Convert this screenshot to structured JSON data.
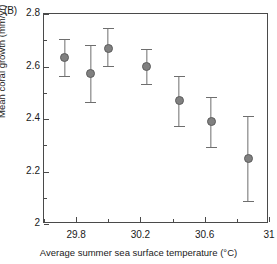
{
  "panel": {
    "label": "(B)"
  },
  "chart_data": {
    "type": "scatter",
    "title": "",
    "panel_label": "(B)",
    "xlabel": "Average summer sea surface temperature (°C)",
    "ylabel": "Mean coral growth (mm/yr)",
    "xlim": [
      29.6,
      31.0
    ],
    "ylim": [
      2.0,
      2.8
    ],
    "grid": false,
    "legend": null,
    "xticks": [
      29.8,
      30.2,
      30.6,
      31
    ],
    "xtick_labels": [
      "29.8",
      "30.2",
      "30.6",
      "31"
    ],
    "xticks_minor": [
      29.6,
      30.0,
      30.4,
      30.8
    ],
    "yticks": [
      2.0,
      2.2,
      2.4,
      2.6,
      2.8
    ],
    "ytick_labels": [
      "2",
      "2.2",
      "2.4",
      "2.6",
      "2.8"
    ],
    "yticks_minor": [
      2.1,
      2.3,
      2.5,
      2.7
    ],
    "marker_color": "#808080",
    "error_color": "#6e6e6e",
    "axis_color": "#4a4a4a",
    "error_type": "error bars",
    "points": [
      {
        "x": 29.73,
        "y": 2.635,
        "y_low": 2.565,
        "y_high": 2.705
      },
      {
        "x": 29.89,
        "y": 2.572,
        "y_low": 2.463,
        "y_high": 2.682
      },
      {
        "x": 30.0,
        "y": 2.67,
        "y_low": 2.602,
        "y_high": 2.745
      },
      {
        "x": 30.24,
        "y": 2.6,
        "y_low": 2.532,
        "y_high": 2.665
      },
      {
        "x": 30.44,
        "y": 2.47,
        "y_low": 2.375,
        "y_high": 2.565
      },
      {
        "x": 30.64,
        "y": 2.392,
        "y_low": 2.295,
        "y_high": 2.485
      },
      {
        "x": 30.87,
        "y": 2.248,
        "y_low": 2.088,
        "y_high": 2.41
      }
    ]
  }
}
